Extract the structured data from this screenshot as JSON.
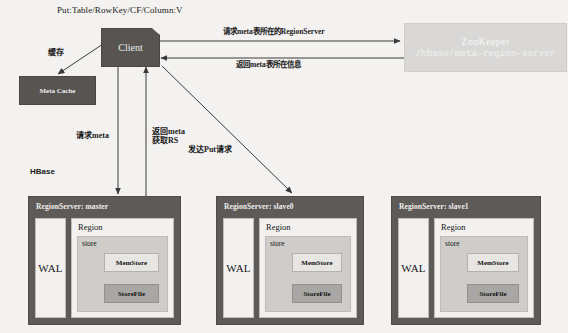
{
  "diagram": {
    "title_label": "Put:Table/RowKey/CF/Column:V",
    "section_label": "HBase"
  },
  "nodes": {
    "client": {
      "label": "Client"
    },
    "meta_cache": {
      "label": "Meta Cache"
    },
    "zookeeper": {
      "title": "ZooKeeper",
      "path": "/hbase/meta-region-server"
    }
  },
  "edges": {
    "zk_request": "请求meta表所在的RegionServer",
    "zk_response": "返回meta表所在信息",
    "cache": "缓存",
    "request_meta": "请求meta",
    "return_meta_line1": "返回meta",
    "return_meta_line2": "获取RS",
    "send_put": "发达Put请求"
  },
  "region_servers": [
    {
      "title": "RegionServer: master",
      "wal": "WAL",
      "region": "Region",
      "store": "store",
      "memstore": "MemStore",
      "storefile": "StoreFile"
    },
    {
      "title": "RegionServer: slave0",
      "wal": "WAL",
      "region": "Region",
      "store": "store",
      "memstore": "MemStore",
      "storefile": "StoreFile"
    },
    {
      "title": "RegionServer: slave1",
      "wal": "WAL",
      "region": "Region",
      "store": "store",
      "memstore": "MemStore",
      "storefile": "StoreFile"
    }
  ],
  "colors": {
    "background": "#f3f2f0",
    "dark_node": "#575451",
    "region_server": "#5d5a57",
    "zookeeper": "#d9d8d6",
    "light_panel": "#f2f1ef",
    "store_panel": "#cecdca",
    "storefile": "#a8a7a4",
    "arrow": "#3a3a3a"
  }
}
